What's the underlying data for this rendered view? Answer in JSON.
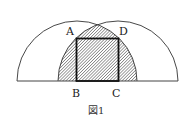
{
  "figure": {
    "caption": "図1",
    "labels": {
      "A": "A",
      "B": "B",
      "C": "C",
      "D": "D"
    },
    "colors": {
      "stroke": "#333333",
      "hatch": "#555555",
      "background": "#ffffff"
    },
    "shapes": {
      "left_semicircle": "center at midpoint between left end and C, radius r",
      "right_semicircle": "center at midpoint between B and right end, radius r",
      "shaded_region": "intersection of two semicircles (hatched)",
      "square": "ABCD inscribed in shaded region, BC on baseline"
    }
  }
}
